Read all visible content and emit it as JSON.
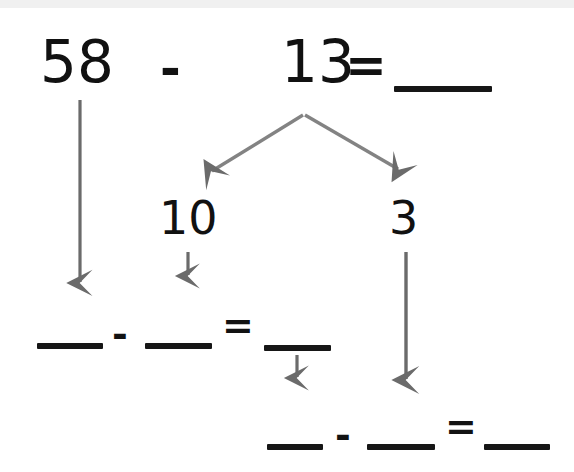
{
  "worksheet": {
    "title": "Subtraction decomposition worksheet",
    "background_color": "#ffffff",
    "ink_color": "#161616",
    "arrow_color": "#6b6b6b",
    "top_scan_band_color": "#f0f0f0"
  },
  "problem": {
    "minuend": "58",
    "operator_1": "-",
    "subtrahend": "13",
    "equals_1": "=",
    "answer_blank": "",
    "decomposition": {
      "part_tens": "10",
      "part_ones": "3"
    },
    "step_1": {
      "left_blank": "",
      "operator": "-",
      "right_blank": "",
      "equals": "=",
      "result_blank": ""
    },
    "step_2": {
      "left_blank": "",
      "operator": "-",
      "right_blank": "",
      "equals": "=",
      "result_blank": ""
    }
  },
  "arrows": {
    "minuend_down": "arrow-down",
    "split_left": "arrow-down-left",
    "split_right": "arrow-down-right",
    "tens_down": "arrow-down",
    "ones_down": "arrow-down",
    "step1_result_down": "arrow-down"
  }
}
